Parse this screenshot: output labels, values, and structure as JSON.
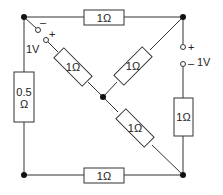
{
  "diagram": {
    "type": "circuit",
    "resistors": {
      "top": "1Ω",
      "left_line1": "0.5",
      "left_line2": "Ω",
      "diag_upper_left": "1Ω",
      "diag_upper_right": "1Ω",
      "diag_lower_right": "1Ω",
      "right": "1Ω",
      "bottom": "1Ω"
    },
    "sources": {
      "left": {
        "voltage": "1V",
        "plus": "+",
        "minus": "–"
      },
      "right": {
        "voltage": "1V",
        "plus": "+",
        "minus": "–"
      }
    },
    "colors": {
      "line": "#333333",
      "node": "#111111"
    }
  }
}
